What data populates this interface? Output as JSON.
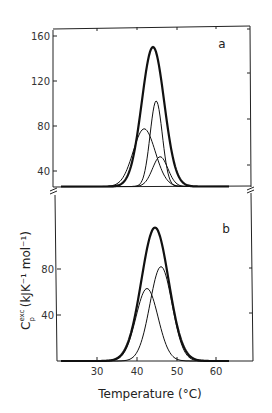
{
  "chart_data": [
    {
      "type": "line",
      "panel_label": "a",
      "title": "",
      "xlabel": "Temperature (°C)",
      "ylabel": "C_p^exc (kJ K^-1 mol^-1)",
      "xlim": [
        19,
        69
      ],
      "ylim": [
        0,
        165
      ],
      "yticks": [
        40,
        80,
        120,
        160
      ],
      "grid": false,
      "legend": "none",
      "series": [
        {
          "name": "total",
          "style": "thick",
          "peak_x": 44.0,
          "peak_y": 150,
          "fwhm": 6.6
        },
        {
          "name": "component 1",
          "style": "thin",
          "peak_x": 41.8,
          "peak_y": 62,
          "fwhm": 6.5
        },
        {
          "name": "component 2",
          "style": "thin",
          "peak_x": 44.8,
          "peak_y": 92,
          "fwhm": 3.6
        },
        {
          "name": "component 3",
          "style": "thin",
          "peak_x": 45.8,
          "peak_y": 32,
          "fwhm": 4.5
        }
      ]
    },
    {
      "type": "line",
      "panel_label": "b",
      "title": "",
      "xlabel": "Temperature (°C)",
      "ylabel": "C_p^exc (kJ K^-1 mol^-1)",
      "xlim": [
        19,
        69
      ],
      "ylim": [
        0,
        120
      ],
      "xticks": [
        30,
        40,
        50,
        60
      ],
      "yticks": [
        40,
        80
      ],
      "grid": false,
      "legend": "none",
      "series": [
        {
          "name": "total",
          "style": "thick",
          "peak_x": 44.5,
          "peak_y": 116,
          "fwhm": 8.0
        },
        {
          "name": "component 1",
          "style": "thin",
          "peak_x": 42.5,
          "peak_y": 63,
          "fwhm": 6.5
        },
        {
          "name": "component 2",
          "style": "thin",
          "peak_x": 46.0,
          "peak_y": 82,
          "fwhm": 6.5
        }
      ]
    }
  ],
  "labels": {
    "panel_a": "a",
    "panel_b": "b",
    "a_y160": "160",
    "a_y120": "120",
    "a_y80": "80",
    "a_y40": "40",
    "b_y80": "80",
    "b_y40": "40",
    "x30": "30",
    "x40": "40",
    "x50": "50",
    "x60": "60",
    "xlabel": "Temperature (°C)",
    "ylabel_main": "C",
    "ylabel_sup": "exc",
    "ylabel_sub": "p",
    "ylabel_units": " (kJK⁻¹ mol⁻¹)"
  }
}
